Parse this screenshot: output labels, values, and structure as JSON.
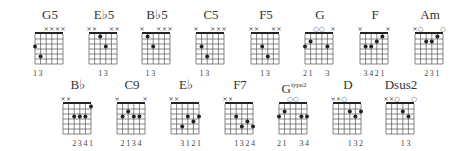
{
  "chords": [
    {
      "name": "G5",
      "x": 30,
      "y": 8,
      "markers": [
        "",
        "",
        "x",
        "x",
        "x",
        "x"
      ],
      "dots": [
        [
          0,
          3
        ],
        [
          1,
          5
        ]
      ],
      "fingers": [
        "1",
        "3",
        "",
        "",
        "",
        ""
      ]
    },
    {
      "name": "E♭5",
      "x": 84,
      "y": 8,
      "markers": [
        "x",
        "x",
        "",
        "",
        "x",
        "x"
      ],
      "dots": [
        [
          2,
          1
        ],
        [
          3,
          3
        ]
      ],
      "fingers": [
        "",
        "",
        "1",
        "3",
        "",
        ""
      ]
    },
    {
      "name": "B♭5",
      "x": 137,
      "y": 8,
      "markers": [
        "x",
        "",
        "",
        "x",
        "x",
        "x"
      ],
      "dots": [
        [
          1,
          1
        ],
        [
          2,
          3
        ]
      ],
      "fingers": [
        "",
        "1",
        "3",
        "",
        "",
        ""
      ]
    },
    {
      "name": "C5",
      "x": 191,
      "y": 8,
      "markers": [
        "x",
        "",
        "",
        "x",
        "x",
        "x"
      ],
      "dots": [
        [
          1,
          3
        ],
        [
          2,
          5
        ]
      ],
      "fingers": [
        "",
        "1",
        "3",
        "",
        "",
        ""
      ]
    },
    {
      "name": "F5",
      "x": 246,
      "y": 8,
      "markers": [
        "x",
        "x",
        "",
        "",
        "x",
        "x"
      ],
      "dots": [
        [
          2,
          3
        ],
        [
          3,
          5
        ]
      ],
      "fingers": [
        "",
        "",
        "1",
        "3",
        "",
        ""
      ]
    },
    {
      "name": "G",
      "x": 300,
      "y": 8,
      "markers": [
        "",
        "",
        "o",
        "o",
        "",
        "x"
      ],
      "dots": [
        [
          0,
          3
        ],
        [
          1,
          2
        ],
        [
          4,
          3
        ]
      ],
      "fingers": [
        "2",
        "1",
        "",
        "",
        "3",
        ""
      ]
    },
    {
      "name": "F",
      "x": 355,
      "y": 8,
      "markers": [
        "x",
        "",
        "",
        "",
        "",
        "x"
      ],
      "dots": [
        [
          1,
          3
        ],
        [
          2,
          3
        ],
        [
          3,
          2
        ],
        [
          4,
          1
        ]
      ],
      "fingers": [
        "",
        "3",
        "4",
        "2",
        "1",
        ""
      ]
    },
    {
      "name": "Am",
      "x": 410,
      "y": 8,
      "markers": [
        "x",
        "o",
        "",
        "",
        "",
        "o"
      ],
      "dots": [
        [
          2,
          2
        ],
        [
          3,
          2
        ],
        [
          4,
          1
        ]
      ],
      "fingers": [
        "",
        "",
        "2",
        "3",
        "1",
        ""
      ]
    },
    {
      "name": "B♭",
      "x": 58,
      "y": 78,
      "markers": [
        "x",
        "x",
        "",
        "",
        "",
        ""
      ],
      "dots": [
        [
          5,
          1
        ],
        [
          2,
          3
        ],
        [
          3,
          3
        ],
        [
          4,
          3
        ]
      ],
      "fingers": [
        "",
        "",
        "2",
        "3",
        "4",
        "1"
      ]
    },
    {
      "name": "C9",
      "x": 112,
      "y": 78,
      "markers": [
        "x",
        "",
        "",
        "",
        "",
        "x"
      ],
      "dots": [
        [
          1,
          3
        ],
        [
          2,
          2
        ],
        [
          3,
          3
        ],
        [
          4,
          3
        ]
      ],
      "fingers": [
        "",
        "2",
        "1",
        "3",
        "4",
        ""
      ]
    },
    {
      "name": "E♭",
      "x": 166,
      "y": 78,
      "markers": [
        "x",
        "x",
        "",
        "",
        "",
        ""
      ],
      "dots": [
        [
          2,
          5
        ],
        [
          3,
          3
        ],
        [
          4,
          4
        ],
        [
          5,
          3
        ]
      ],
      "fingers": [
        "",
        "",
        "3",
        "1",
        "2",
        "1"
      ]
    },
    {
      "name": "F7",
      "x": 220,
      "y": 78,
      "markers": [
        "x",
        "x",
        "",
        "",
        "",
        ""
      ],
      "dots": [
        [
          2,
          3
        ],
        [
          3,
          5
        ],
        [
          4,
          4
        ],
        [
          5,
          5
        ]
      ],
      "fingers": [
        "",
        "",
        "1",
        "3",
        "2",
        "4"
      ]
    },
    {
      "name": "G",
      "sup": "type2",
      "x": 274,
      "y": 78,
      "markers": [
        "",
        "",
        "o",
        "o",
        "",
        ""
      ],
      "dots": [
        [
          0,
          3
        ],
        [
          1,
          2
        ],
        [
          4,
          3
        ],
        [
          5,
          3
        ]
      ],
      "fingers": [
        "2",
        "1",
        "",
        "",
        "3",
        "4"
      ]
    },
    {
      "name": "D",
      "x": 328,
      "y": 78,
      "markers": [
        "x",
        "x",
        "o",
        "",
        "",
        ""
      ],
      "dots": [
        [
          3,
          2
        ],
        [
          4,
          3
        ],
        [
          5,
          2
        ]
      ],
      "fingers": [
        "",
        "",
        "",
        "1",
        "3",
        "2"
      ]
    },
    {
      "name": "Dsus2",
      "x": 381,
      "y": 78,
      "markers": [
        "x",
        "x",
        "o",
        "",
        "",
        "o"
      ],
      "dots": [
        [
          3,
          2
        ],
        [
          4,
          3
        ]
      ],
      "fingers": [
        "",
        "",
        "",
        "1",
        "3",
        ""
      ]
    }
  ],
  "layout": {
    "string_spacing": 5.6,
    "fret_spacing": 5,
    "frets": 6,
    "ink": "#222222"
  }
}
